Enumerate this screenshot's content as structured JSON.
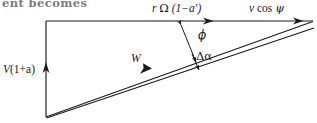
{
  "figure": {
    "type": "velocity-vector-triangle-diagram",
    "clipped_caption_above": "ent becomes",
    "ink_color": "#1a1a1a",
    "background_color": "#ffffff"
  },
  "labels": {
    "rotational_velocity": "r Ω (1−a′)",
    "rotational_velocity_parts": {
      "radius": "r",
      "omega": "Ω",
      "factor": "(1−a′)"
    },
    "axial_right": "v cos ψ",
    "axial_right_parts": {
      "speed": "v",
      "trig": "cos",
      "angle": "ψ"
    },
    "axial_left": "V (1+a)",
    "axial_left_parts": {
      "speed": "V",
      "factor": "(1+a)"
    },
    "relative_velocity": "W",
    "flow_angle": "ϕ",
    "angle_change": "Δα"
  },
  "geometry": {
    "apex_bottom_left": [
      46,
      117
    ],
    "corner_top_left": [
      46,
      21
    ],
    "corner_top_right": [
      313,
      21
    ],
    "convergence_right": [
      313,
      22
    ],
    "w_line_end": [
      312,
      25
    ],
    "lower_line_end": [
      314,
      28
    ]
  },
  "arrows": {
    "rotational_arrowhead_x": 213,
    "axial_right_arrowhead_x": 303,
    "axial_left_arrowhead_y": 63,
    "w_arrowhead_x": 150,
    "perpendicular_double_arrow": true,
    "dalpha_arrow": true
  }
}
